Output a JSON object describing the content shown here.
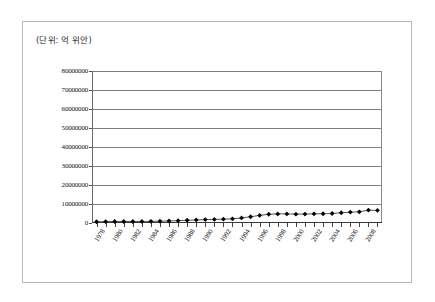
{
  "figure": {
    "unit_label": "(단위: 억 위안)"
  },
  "chart_data": {
    "type": "line",
    "title": "",
    "subtitle": "",
    "xlabel": "",
    "ylabel": "",
    "unit_note": "(단위: 억 위안)",
    "grid": true,
    "legend": false,
    "marker": "diamond",
    "marker_color": "#000000",
    "line_color": "#555555",
    "ylim": [
      0,
      80000000
    ],
    "ytick_step": 10000000,
    "ytick_labels": [
      "80000000",
      "70000000",
      "60000000",
      "50000000",
      "40000000",
      "30000000",
      "20000000",
      "10000000",
      "0"
    ],
    "ytick_values": [
      80000000,
      70000000,
      60000000,
      50000000,
      40000000,
      30000000,
      20000000,
      10000000,
      0
    ],
    "xtick_labels": [
      "1978",
      "1980",
      "1982",
      "1984",
      "1986",
      "1988",
      "1990",
      "1992",
      "1994",
      "1996",
      "1998",
      "2000",
      "2002",
      "2004",
      "2006",
      "2008"
    ],
    "x": [
      1978,
      1979,
      1980,
      1981,
      1982,
      1983,
      1984,
      1985,
      1986,
      1987,
      1988,
      1989,
      1990,
      1991,
      1992,
      1993,
      1994,
      1995,
      1996,
      1997,
      1998,
      1999,
      2000,
      2001,
      2002,
      2003,
      2004,
      2005,
      2006,
      2007,
      2008,
      2009
    ],
    "values": [
      650000,
      750000,
      780000,
      800000,
      800000,
      810000,
      860000,
      980000,
      1050000,
      1250000,
      1450000,
      1600000,
      1780000,
      1900000,
      2000000,
      2200000,
      2650000,
      3300000,
      4000000,
      4600000,
      4800000,
      4800000,
      4650000,
      4700000,
      4820000,
      4880000,
      5000000,
      5400000,
      5680000,
      5900000,
      6750000,
      6600000
    ],
    "series": [
      {
        "name": "series-1",
        "values": [
          650000,
          750000,
          780000,
          800000,
          800000,
          810000,
          860000,
          980000,
          1050000,
          1250000,
          1450000,
          1600000,
          1780000,
          1900000,
          2000000,
          2200000,
          2650000,
          3300000,
          4000000,
          4600000,
          4800000,
          4800000,
          4650000,
          4700000,
          4820000,
          4880000,
          5000000,
          5400000,
          5680000,
          5900000,
          6750000,
          6600000
        ]
      }
    ]
  }
}
